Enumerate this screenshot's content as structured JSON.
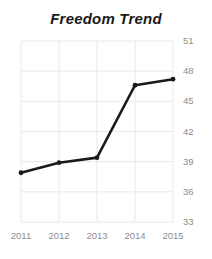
{
  "chart_data": {
    "type": "line",
    "title": "Freedom Trend",
    "xlabel": "",
    "ylabel": "",
    "categories": [
      "2011",
      "2012",
      "2013",
      "2014",
      "2015"
    ],
    "x": [
      2011,
      2012,
      2013,
      2014,
      2015
    ],
    "values": [
      37.9,
      38.9,
      39.4,
      46.6,
      47.2
    ],
    "series": [
      {
        "name": "Freedom Trend",
        "values": [
          37.9,
          38.9,
          39.4,
          46.6,
          47.2
        ]
      }
    ],
    "ylim": [
      33,
      51
    ],
    "y_ticks": [
      33,
      36,
      39,
      42,
      45,
      48,
      51
    ],
    "y_tick_labels": [
      "33",
      "36",
      "39",
      "42",
      "45",
      "48",
      "51"
    ],
    "x_tick_labels": [
      "2011",
      "2012",
      "2013",
      "2014",
      "2015"
    ],
    "grid": true,
    "grid_axes": "both",
    "legend": false,
    "legend_position": "none",
    "markers": true,
    "marker_shape": "circle",
    "annotations": [],
    "colors": {
      "line": "#1a1a1a",
      "marker": "#1a1a1a",
      "grid": "#e8e8ec",
      "tick_label": "#8c8c8c",
      "title": "#1a1a1a",
      "background": "#ffffff"
    }
  }
}
